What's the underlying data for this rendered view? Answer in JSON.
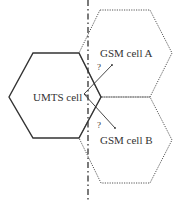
{
  "diagram": {
    "umts_cell": {
      "label": "UMTS cell"
    },
    "gsm_cell_a": {
      "label": "GSM cell A"
    },
    "gsm_cell_b": {
      "label": "GSM cell B"
    },
    "arrow_a": {
      "label": "?"
    },
    "arrow_b": {
      "label": "?"
    },
    "colors": {
      "stroke": "#333333",
      "dotted": "#555555"
    }
  }
}
